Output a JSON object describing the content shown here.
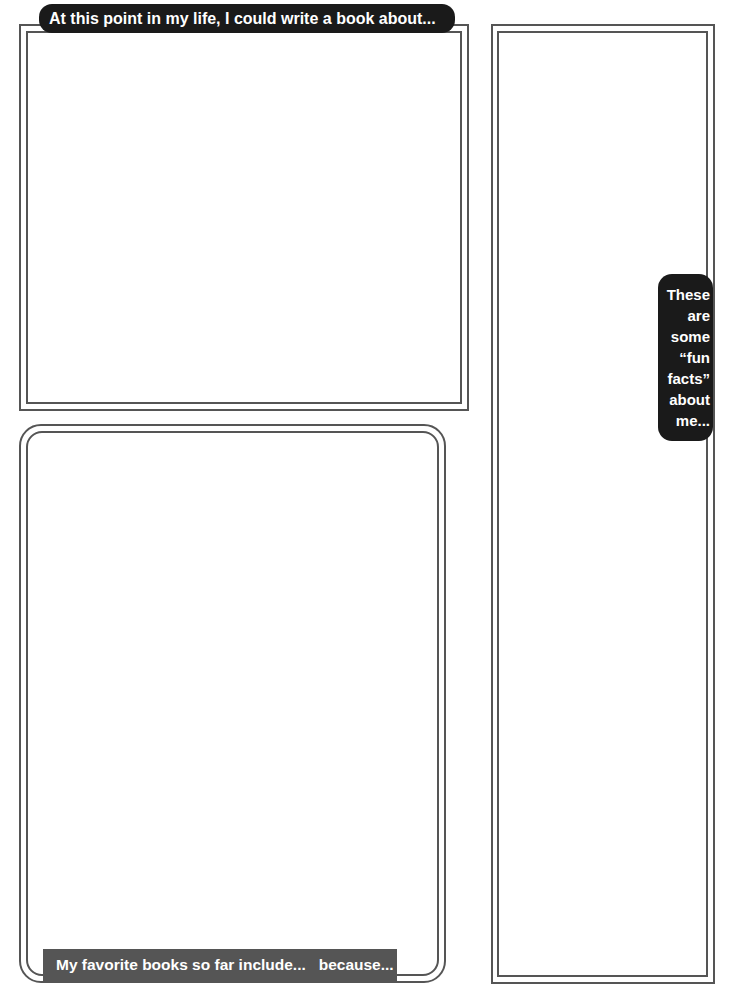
{
  "worksheet": {
    "book_section": {
      "prompt": "At this point in my life, I could write a book about...",
      "content": ""
    },
    "favorites_section": {
      "prompt": "My favorite books so far include...   because...",
      "content": ""
    },
    "fun_facts_section": {
      "prompt_lines": [
        "These",
        "are",
        "some",
        "“fun",
        "facts”",
        "about",
        "me..."
      ],
      "content": ""
    }
  }
}
